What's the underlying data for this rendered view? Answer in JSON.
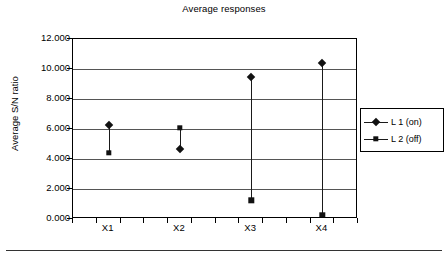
{
  "chart_data": {
    "type": "scatter",
    "title": "Average responses",
    "xlabel": "",
    "ylabel": "Average S/N ratio",
    "categories": [
      "X1",
      "X2",
      "X3",
      "X4"
    ],
    "series": [
      {
        "name": "L 1 (on)",
        "marker": "diamond",
        "values": [
          6.3,
          4.65,
          9.45,
          10.4
        ]
      },
      {
        "name": "L 2 (off)",
        "marker": "square",
        "values": [
          4.4,
          6.1,
          1.25,
          0.3
        ]
      }
    ],
    "ylim": [
      0.0,
      12.0
    ],
    "ytick_step": 2.0,
    "ytick_labels": [
      "12.000",
      "10.000",
      "8.000",
      "6.000",
      "4.000",
      "2.000",
      "0.000"
    ],
    "ytick_values": [
      12.0,
      10.0,
      8.0,
      6.0,
      4.0,
      2.0,
      0.0
    ],
    "grid": true,
    "legend_position": "right-outside",
    "connector_lines": true
  },
  "chart": {
    "title": "Average responses",
    "y_axis_title": "Average S/N ratio",
    "y_ticks": [
      {
        "label": "12.000"
      },
      {
        "label": "10.000"
      },
      {
        "label": "8.000"
      },
      {
        "label": "6.000"
      },
      {
        "label": "4.000"
      },
      {
        "label": "2.000"
      },
      {
        "label": "0.000"
      }
    ],
    "x_ticks": [
      {
        "label": "X1"
      },
      {
        "label": "X2"
      },
      {
        "label": "X3"
      },
      {
        "label": "X4"
      }
    ],
    "legend": {
      "items": [
        {
          "label": "L 1 (on)",
          "marker": "diamond-marker-icon"
        },
        {
          "label": "L 2 (off)",
          "marker": "square-marker-icon"
        }
      ]
    },
    "colors": {
      "series": "#111111",
      "gridline": "#555555",
      "axis": "#000000",
      "background": "#ffffff"
    }
  }
}
